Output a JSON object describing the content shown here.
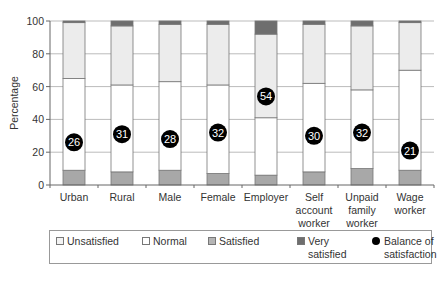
{
  "chart_data": {
    "type": "bar",
    "stacked": true,
    "title": "",
    "xlabel": "",
    "ylabel": "Percentage",
    "ylim": [
      0,
      100
    ],
    "yticks": [
      0,
      20,
      40,
      60,
      80,
      100
    ],
    "grid": true,
    "legend_position": "bottom",
    "categories": [
      "Urban",
      "Rural",
      "Male",
      "Female",
      "Employer",
      "Self account worker",
      "Unpaid family worker",
      "Wage worker"
    ],
    "series": [
      {
        "name": "Unsatisfied",
        "color": "#a8a8a8",
        "values": [
          9,
          8,
          9,
          7,
          6,
          8,
          10,
          9
        ]
      },
      {
        "name": "Normal",
        "color": "#ffffff",
        "values": [
          56,
          53,
          54,
          54,
          35,
          54,
          48,
          61
        ]
      },
      {
        "name": "Satisfied",
        "color": "#ececec",
        "values": [
          34,
          36,
          35,
          37,
          51,
          36,
          39,
          29
        ]
      },
      {
        "name": "Very satisfied",
        "color": "#6e6e6e",
        "values": [
          1,
          3,
          2,
          2,
          8,
          2,
          3,
          1
        ]
      }
    ],
    "overlay": {
      "name": "Balance of satisfaction",
      "type": "scatter",
      "marker": "filled-circle",
      "values": [
        26,
        31,
        28,
        32,
        54,
        30,
        32,
        21
      ]
    }
  },
  "axis": {
    "ylabel": "Percentage",
    "yticks": [
      "0",
      "20",
      "40",
      "60",
      "80",
      "100"
    ],
    "xlabels": [
      [
        "Urban"
      ],
      [
        "Rural"
      ],
      [
        "Male"
      ],
      [
        "Female"
      ],
      [
        "Employer"
      ],
      [
        "Self",
        "account",
        "worker"
      ],
      [
        "Unpaid",
        "family",
        "worker"
      ],
      [
        "Wage",
        "worker"
      ]
    ]
  },
  "legend": {
    "items": [
      {
        "label": "Unsatisfied",
        "label2": "",
        "swatch": "#f3f3f3"
      },
      {
        "label": "Normal",
        "label2": "",
        "swatch": "#ffffff"
      },
      {
        "label": "Satisfied",
        "label2": "",
        "swatch": "#b5b5b5"
      },
      {
        "label": "Very",
        "label2": "satisfied",
        "swatch": "#6e6e6e"
      },
      {
        "label": "Balance of",
        "label2": "satisfaction",
        "swatch": "dot"
      }
    ]
  }
}
